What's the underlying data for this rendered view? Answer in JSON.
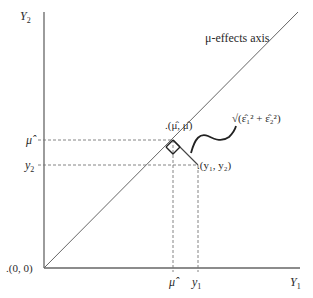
{
  "diagram": {
    "y_axis_label": "Y",
    "y_axis_sub": "2",
    "x_axis_label": "Y",
    "x_axis_sub": "1",
    "origin_label": ".(0, 0)",
    "diagonal_label": "μ-effects axis",
    "mu_hat_label": "μ̂",
    "y2_label": "y",
    "y2_sub": "2",
    "y1_label": "y",
    "y1_sub": "1",
    "projection_point_label": ".(μ̂, μ̂)",
    "observation_point_label": ".(y₁, y₂)",
    "distance_label": "√(ε̂₁² + ε̂₂²)",
    "colors": {
      "axis": "#555555",
      "dashed": "#777777",
      "text": "#2a2a2a"
    }
  }
}
